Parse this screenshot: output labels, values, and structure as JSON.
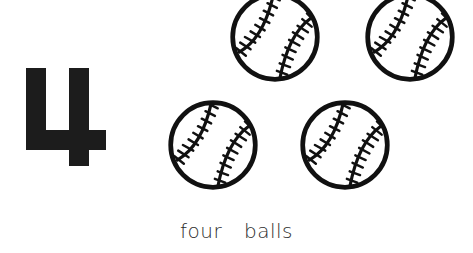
{
  "card": {
    "numeral": "4",
    "numeral_icon": "digit-four-glyph",
    "caption": "four  balls",
    "count": 4,
    "object_name": "baseball",
    "background_color": "#ffffff",
    "ink_color": "#111111",
    "numeral_color": "#1c1c1c",
    "caption_color": "#2b2b2b"
  },
  "balls": [
    {
      "id": "ball-1",
      "position": "top-left",
      "icon": "baseball-icon",
      "label": "baseball 1"
    },
    {
      "id": "ball-2",
      "position": "top-right",
      "icon": "baseball-icon",
      "label": "baseball 2"
    },
    {
      "id": "ball-3",
      "position": "bottom-left",
      "icon": "baseball-icon",
      "label": "baseball 3"
    },
    {
      "id": "ball-4",
      "position": "bottom-right",
      "icon": "baseball-icon",
      "label": "baseball 4"
    }
  ]
}
